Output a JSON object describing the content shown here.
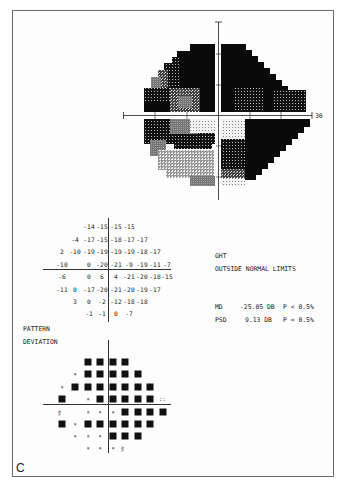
{
  "figure": {
    "panel_label": "C",
    "greyscale": {
      "axis_label": "30",
      "description": "Greyscale visual field plot, 30-degree field"
    },
    "total_deviation": {
      "rows": [
        {
          "cols": [
            null,
            null,
            "-14",
            "-15",
            "-15",
            "-15",
            null,
            null,
            null
          ]
        },
        {
          "cols": [
            null,
            "-4",
            "-17",
            "-15",
            "-18",
            "-17",
            "-17",
            null,
            null
          ]
        },
        {
          "cols": [
            "2",
            "-10",
            "-19",
            "-19",
            "-19",
            "-19",
            "-18",
            "-17",
            null
          ]
        },
        {
          "cols": [
            "-10",
            null,
            "0",
            "-20",
            "-21",
            "-9",
            "-19",
            "-11",
            "-7"
          ]
        },
        {
          "cols": [
            "-6",
            null,
            "0",
            "6",
            "4",
            "-21",
            "-20",
            "-18",
            "-15"
          ]
        },
        {
          "cols": [
            "-11",
            "0",
            "-17",
            "-20",
            "-21",
            "-20",
            "-19",
            "-17",
            null
          ]
        },
        {
          "cols": [
            null,
            "3",
            "0",
            "-2",
            "-12",
            "-18",
            "-18",
            null,
            null
          ]
        },
        {
          "cols": [
            null,
            null,
            "-1",
            "-1",
            "0",
            "-7",
            null,
            null,
            null
          ]
        }
      ]
    },
    "ght": {
      "label": "GHT",
      "result": "OUTSIDE NORMAL LIMITS"
    },
    "indices": {
      "md_label": "MD",
      "md_value": "-25.05 DB",
      "md_p": "P < 0.5%",
      "psd_label": "PSD",
      "psd_value": "9.13 DB",
      "psd_p": "P < 0.5%"
    },
    "pattern_deviation": {
      "title_line1": "PATTERN",
      "title_line2": "DEVIATION",
      "rows": [
        [
          null,
          null,
          "sq",
          "sq",
          "sq",
          "sq",
          null,
          null,
          null
        ],
        [
          null,
          "dot",
          "sq",
          "sq",
          "sq",
          "sq",
          "sq",
          null,
          null
        ],
        [
          "dot",
          "sq",
          "sq",
          "sq",
          "sq",
          "sq",
          "sq",
          "sq",
          null
        ],
        [
          "sq",
          null,
          "dot",
          "sq",
          "sq",
          "sq",
          "sq",
          "sq",
          "p5"
        ],
        [
          "p2",
          null,
          "dot",
          "dot",
          "dot",
          "sq",
          "sq",
          "sq",
          "sq"
        ],
        [
          "sq",
          "dot",
          "sq",
          "sq",
          "sq",
          "sq",
          "sq",
          "sq",
          null
        ],
        [
          null,
          "dot",
          "dot",
          "dot",
          "sq",
          "sq",
          "sq",
          null,
          null
        ],
        [
          null,
          null,
          "dot",
          "dot",
          "dot",
          "p2",
          null,
          null,
          null
        ]
      ],
      "symbols": {
        "p5": "::",
        "p2": "ﾀ"
      }
    }
  }
}
